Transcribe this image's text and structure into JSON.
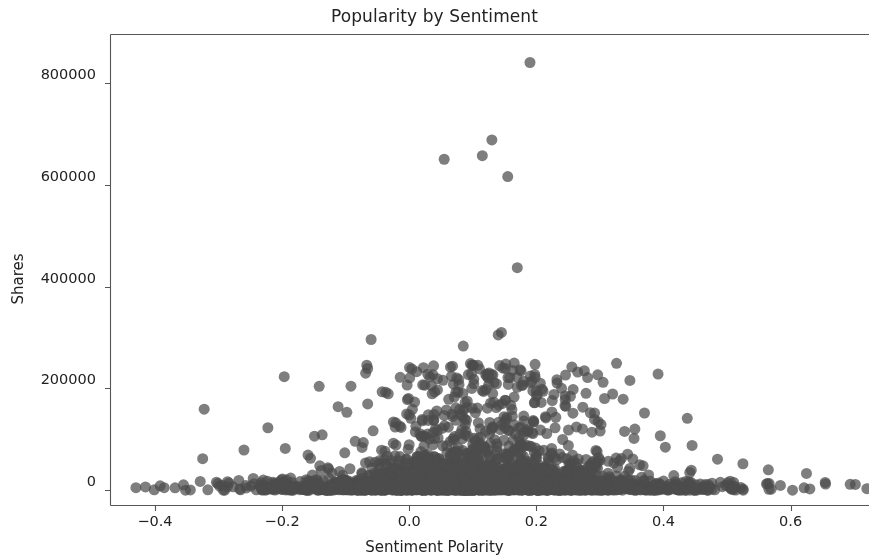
{
  "chart_data": {
    "type": "scatter",
    "title": "Popularity by Sentiment",
    "xlabel": "Sentiment Polarity",
    "ylabel": "Shares",
    "xlim": [
      -0.47,
      0.78
    ],
    "ylim": [
      -30000,
      895000
    ],
    "xticks": [
      -0.4,
      -0.2,
      0.0,
      0.2,
      0.4,
      0.6
    ],
    "xtick_labels": [
      "−0.4",
      "−0.2",
      "0.0",
      "0.2",
      "0.4",
      "0.6"
    ],
    "yticks": [
      0,
      200000,
      400000,
      600000,
      800000
    ],
    "ytick_labels": [
      "0",
      "200000",
      "400000",
      "600000",
      "800000"
    ],
    "grid": false,
    "legend": null,
    "marker": {
      "color": "#4c4c4c",
      "size": 11,
      "alpha": 0.72,
      "shape": "circle"
    },
    "series": [
      {
        "name": "articles",
        "n_points": 2400,
        "notable_points": [
          [
            0.19,
            840000
          ],
          [
            0.13,
            688000
          ],
          [
            0.115,
            657000
          ],
          [
            0.055,
            650000
          ],
          [
            0.155,
            616000
          ],
          [
            0.17,
            437000
          ],
          [
            0.145,
            310000
          ],
          [
            0.14,
            305000
          ],
          [
            0.085,
            283000
          ],
          [
            -0.06,
            296000
          ],
          [
            0.265,
            232000
          ],
          [
            0.305,
            212000
          ],
          [
            0.125,
            207000
          ],
          [
            0.035,
            205000
          ],
          [
            0.04,
            193000
          ],
          [
            0.115,
            196000
          ],
          [
            0.32,
            189000
          ],
          [
            0.165,
            183000
          ],
          [
            0.225,
            176000
          ],
          [
            0.245,
            166000
          ],
          [
            0.285,
            152000
          ],
          [
            0.0,
            148000
          ],
          [
            0.215,
            142000
          ],
          [
            0.195,
            137000
          ],
          [
            -0.015,
            126000
          ],
          [
            0.355,
            120000
          ],
          [
            0.395,
            107000
          ],
          [
            -0.085,
            96000
          ],
          [
            0.445,
            88000
          ],
          [
            -0.195,
            82000
          ],
          [
            -0.26,
            79000
          ],
          [
            -0.325,
            62000
          ],
          [
            0.485,
            61000
          ],
          [
            0.525,
            52000
          ],
          [
            0.565,
            40000
          ],
          [
            0.625,
            33000
          ],
          [
            0.655,
            12000
          ],
          [
            0.72,
            3000
          ],
          [
            -0.43,
            5000
          ]
        ],
        "distribution": {
          "x_mode": 0.12,
          "x_spread": 0.13,
          "x_min": -0.44,
          "x_max": 0.73,
          "y_base_scale": 16000,
          "y_peak_factor": 6.0,
          "description": "dense band near y=0 across full x range, fanning upward near x=0.1-0.2"
        }
      }
    ]
  },
  "axes": {
    "spine_color": "#555555",
    "background": "#ffffff",
    "tick_color": "#555555",
    "text_color": "#222222"
  }
}
